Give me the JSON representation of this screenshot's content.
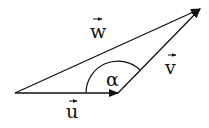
{
  "diagram": {
    "colors": {
      "stroke": "#111111",
      "background": "#ffffff"
    },
    "vectors": [
      {
        "id": "u",
        "label": "u",
        "from": [
          15,
          93
        ],
        "to": [
          118,
          93
        ]
      },
      {
        "id": "v",
        "label": "v",
        "from": [
          118,
          93
        ],
        "to": [
          200,
          9
        ]
      },
      {
        "id": "w",
        "label": "w",
        "from": [
          15,
          93
        ],
        "to": [
          200,
          9
        ]
      }
    ],
    "angle": {
      "label": "α",
      "vertex": [
        118,
        93
      ],
      "radius": 32
    }
  }
}
